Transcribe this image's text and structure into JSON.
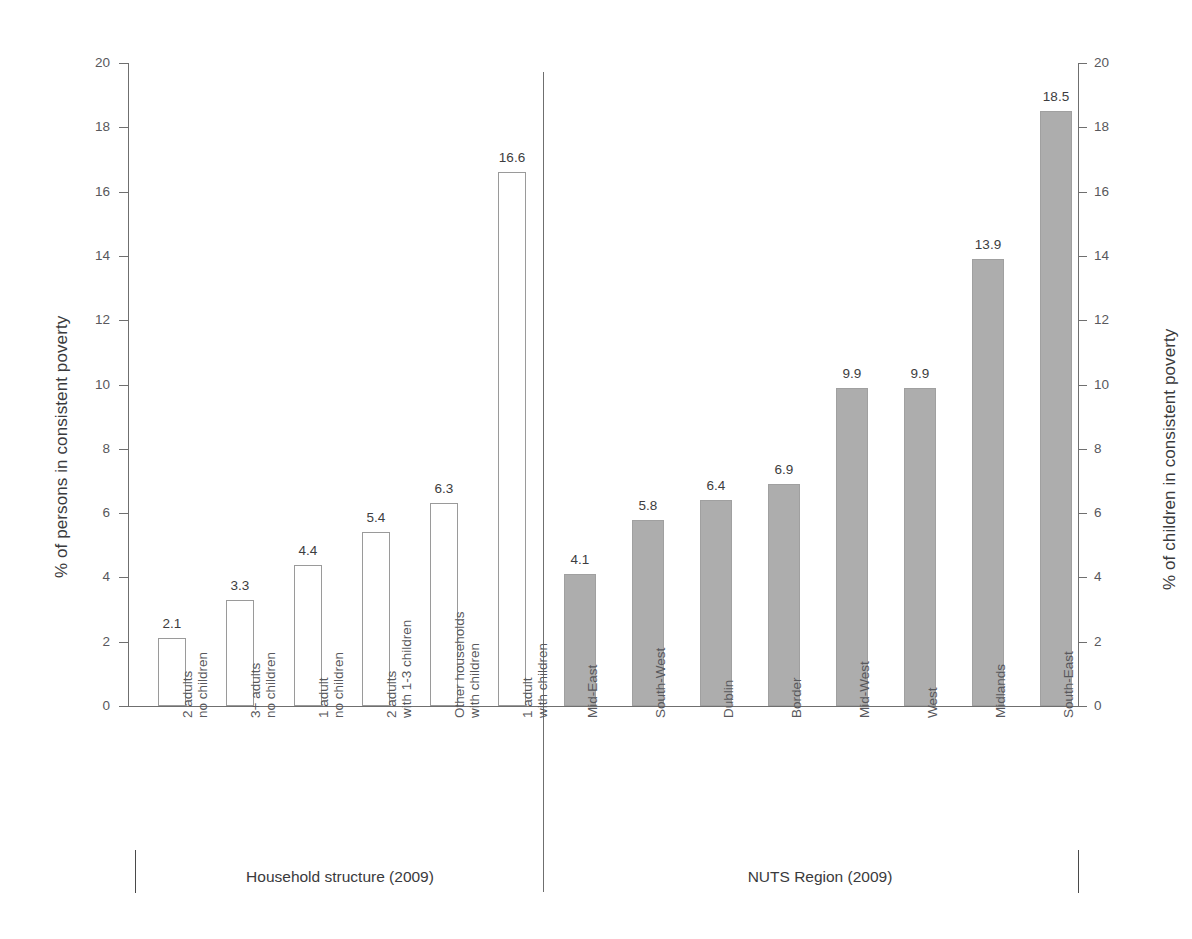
{
  "title": "",
  "axes": {
    "left_title": "% of persons in consistent poverty",
    "right_title": "% of children in consistent poverty",
    "ticks": [
      "0",
      "2",
      "4",
      "6",
      "8",
      "10",
      "12",
      "14",
      "16",
      "18",
      "20"
    ]
  },
  "groups": [
    {
      "label": "Household structure (2009)"
    },
    {
      "label": "NUTS Region (2009)"
    }
  ],
  "left_group": {
    "categories": [
      {
        "line1": "2 adults",
        "line2": "no children"
      },
      {
        "line1": "3+ adults",
        "line2": "no children"
      },
      {
        "line1": "1 adult",
        "line2": "no children"
      },
      {
        "line1": "2 adults",
        "line2": "with 1-3 children"
      },
      {
        "line1": "Other households",
        "line2": "with children"
      },
      {
        "line1": "1 adult",
        "line2": "with children"
      }
    ],
    "values": [
      "2.1",
      "3.3",
      "4.4",
      "5.4",
      "6.3",
      "16.6"
    ]
  },
  "right_group": {
    "categories": [
      {
        "line1": "Mid-East",
        "line2": ""
      },
      {
        "line1": "South-West",
        "line2": ""
      },
      {
        "line1": "Dublin",
        "line2": ""
      },
      {
        "line1": "Border",
        "line2": ""
      },
      {
        "line1": "Mid-West",
        "line2": ""
      },
      {
        "line1": "West",
        "line2": ""
      },
      {
        "line1": "Midlands",
        "line2": ""
      },
      {
        "line1": "South-East",
        "line2": ""
      }
    ],
    "values": [
      "4.1",
      "5.8",
      "6.4",
      "6.9",
      "9.9",
      "9.9",
      "13.9",
      "18.5"
    ]
  },
  "chart_data": {
    "type": "bar",
    "title": "",
    "xlabel": "",
    "ylabel": "% of persons in consistent poverty",
    "y2label": "% of children in consistent poverty",
    "ylim": [
      0,
      20
    ],
    "y_ticks": [
      0,
      2,
      4,
      6,
      8,
      10,
      12,
      14,
      16,
      18,
      20
    ],
    "grid": false,
    "legend": "none",
    "panels": [
      {
        "name": "Household structure (2009)",
        "axis": "left",
        "bar_style": "hollow-white-gray-outline",
        "categories": [
          "2 adults no children",
          "3+ adults no children",
          "1 adult no children",
          "2 adults with 1-3 children",
          "Other households with children",
          "1 adult with children"
        ],
        "values": [
          2.1,
          3.3,
          4.4,
          5.4,
          6.3,
          16.6
        ]
      },
      {
        "name": "NUTS Region (2009)",
        "axis": "right",
        "bar_style": "filled-gray",
        "categories": [
          "Mid-East",
          "South-West",
          "Dublin",
          "Border",
          "Mid-West",
          "West",
          "Midlands",
          "South-East"
        ],
        "values": [
          4.1,
          5.8,
          6.4,
          6.9,
          9.9,
          9.9,
          13.9,
          18.5
        ]
      }
    ]
  },
  "colors": {
    "bar_fill_gray": "#adadad",
    "bar_outline": "#9a9a9a",
    "axis": "#6f6f6f",
    "text": "#3c3c3c",
    "tick_text": "#58585c",
    "background": "#ffffff"
  }
}
